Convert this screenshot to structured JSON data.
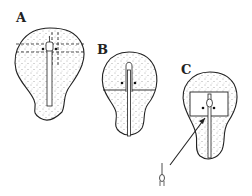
{
  "figure": {
    "panels": [
      {
        "label": "A",
        "description": "Embryo outline with dashed cut lines around the primitive node"
      },
      {
        "label": "B",
        "description": "Embryo with horizontal transverse cut through the node"
      },
      {
        "label": "C",
        "description": "Embryo with rectangular excised region around node; arrow points to isolated node fragment"
      }
    ],
    "colors": {
      "stroke": "#222222",
      "fill": "#ffffff",
      "stipple": "#555555"
    }
  }
}
